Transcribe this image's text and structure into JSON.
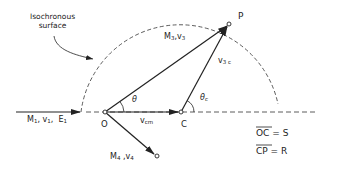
{
  "diagram": {
    "type": "kinematics-vector-diagram",
    "annotation": {
      "line1": "Isochronous",
      "line2": "surface"
    },
    "points": {
      "O": "O",
      "C": "C",
      "P": "P"
    },
    "vectors": {
      "incident": {
        "mass": "M",
        "mass_sub": "1",
        "vel": "v",
        "vel_sub": "1",
        "energy": "E",
        "energy_sub": "1"
      },
      "ejectile": {
        "mass": "M",
        "mass_sub": "3",
        "vel": "v",
        "vel_sub": "3"
      },
      "v3c": {
        "sym": "v",
        "sub": "3 c"
      },
      "vcm": {
        "sym": "v",
        "sub": "cm"
      },
      "recoil": {
        "mass": "M",
        "mass_sub": "4",
        "vel": "v",
        "vel_sub": "4"
      }
    },
    "angles": {
      "theta": "θ",
      "theta_c": "θ",
      "theta_c_sub": "c"
    },
    "equations": {
      "oc_lhs": "OC",
      "oc_rhs": "S",
      "cp_lhs": "CP",
      "cp_rhs": "R",
      "eq": "="
    },
    "colors": {
      "ink": "#222222",
      "background": "#ffffff"
    }
  }
}
